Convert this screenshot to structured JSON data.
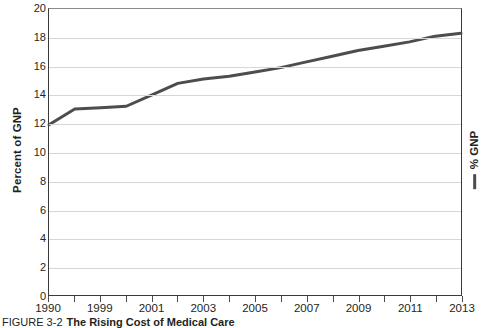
{
  "figure": {
    "number_label": "FIGURE 3-2",
    "title": "The Rising Cost of Medical Care"
  },
  "axes": {
    "ylabel": "Percent of GNP",
    "xlabel": "",
    "y_ticks": [
      0,
      2,
      4,
      6,
      8,
      10,
      12,
      14,
      16,
      18,
      20
    ],
    "y_tick_labels": [
      "0",
      "2",
      "4",
      "6",
      "8",
      "10",
      "12",
      "14",
      "16",
      "18",
      "20"
    ],
    "x_tick_labels": [
      "1990",
      "1999",
      "2001",
      "2003",
      "2005",
      "2007",
      "2009",
      "2011",
      "2013"
    ]
  },
  "legend": {
    "position": "right",
    "entries": [
      {
        "label": "% GNP",
        "color": "#4d4d4d",
        "marker": "line"
      }
    ]
  },
  "colors": {
    "series_line": "#4d4d4d",
    "axis": "#3a3a3a",
    "grid": "#d7d7d7",
    "text": "#231f20",
    "background": "#ffffff"
  },
  "chart_data": {
    "type": "line",
    "title": "The Rising Cost of Medical Care",
    "xlabel": "",
    "ylabel": "Percent of GNP",
    "ylim": [
      0,
      20
    ],
    "grid": true,
    "legend_position": "right",
    "categories": [
      "1990",
      "1999",
      "2000",
      "2001",
      "2002",
      "2003",
      "2004",
      "2005",
      "2006",
      "2007",
      "2008",
      "2009",
      "2010",
      "2011",
      "2012",
      "2013",
      "2014"
    ],
    "series": [
      {
        "name": "% GNP",
        "color": "#4d4d4d",
        "values": [
          11.9,
          13.0,
          13.1,
          13.2,
          14.0,
          14.8,
          15.1,
          15.3,
          15.6,
          15.9,
          16.3,
          16.7,
          17.1,
          17.4,
          17.7,
          18.1,
          18.3
        ]
      }
    ]
  }
}
